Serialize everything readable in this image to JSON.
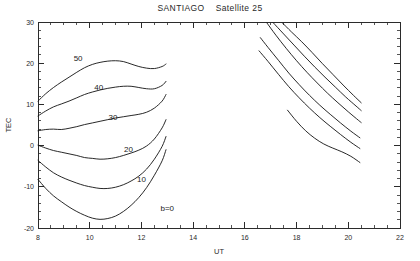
{
  "chart_data": {
    "type": "line",
    "title": "SANTIAGO    Satellite 25",
    "station": "SANTIAGO",
    "satellite_label": "Satellite 25",
    "xlabel": "UT",
    "ylabel": "TEC",
    "xlim": [
      8,
      22
    ],
    "ylim": [
      -20,
      30
    ],
    "xticks": [
      8,
      10,
      12,
      14,
      16,
      18,
      20,
      22
    ],
    "xtick_labels": [
      "8",
      "10",
      "12",
      "14",
      "16",
      "18",
      "20",
      "22"
    ],
    "yticks": [
      -20,
      -10,
      0,
      10,
      20,
      30
    ],
    "ytick_labels": [
      "-20",
      "-10",
      "0",
      "10",
      "20",
      "30"
    ],
    "minor_tick_step_x": 0.5,
    "minor_tick_step_y": 2,
    "grid": false,
    "legend": "none",
    "annotations": [
      {
        "text": "50",
        "x": 9.55,
        "y": 20.6
      },
      {
        "text": "40",
        "x": 10.35,
        "y": 13.4
      },
      {
        "text": "30",
        "x": 10.9,
        "y": 6.1
      },
      {
        "text": "20",
        "x": 11.5,
        "y": -1.6
      },
      {
        "text": "10",
        "x": 12.0,
        "y": -8.9
      },
      {
        "text": "b=0",
        "x": 13.0,
        "y": -15.8
      }
    ],
    "series": [
      {
        "name": "b=50 pass 1",
        "bias": 50,
        "pass": 1,
        "x": [
          8.0,
          8.3,
          8.6,
          8.9,
          9.2,
          9.5,
          9.8,
          10.1,
          10.4,
          10.7,
          11.0,
          11.3,
          11.6,
          11.9,
          12.2,
          12.5,
          12.8,
          12.95
        ],
        "y": [
          10.8,
          12.6,
          14.1,
          15.4,
          16.6,
          17.8,
          18.9,
          19.7,
          20.2,
          20.5,
          20.6,
          20.4,
          19.8,
          19.2,
          18.8,
          18.7,
          19.2,
          19.8
        ]
      },
      {
        "name": "b=40 pass 1",
        "bias": 40,
        "pass": 1,
        "x": [
          8.0,
          8.3,
          8.6,
          8.9,
          9.2,
          9.5,
          9.8,
          10.1,
          10.4,
          10.7,
          11.0,
          11.3,
          11.6,
          11.9,
          12.2,
          12.5,
          12.8,
          12.95
        ],
        "y": [
          7.2,
          8.4,
          9.4,
          10.1,
          10.8,
          11.6,
          12.4,
          13.0,
          13.5,
          13.9,
          14.2,
          14.4,
          14.4,
          14.1,
          13.8,
          13.8,
          14.6,
          15.6
        ]
      },
      {
        "name": "b=30 pass 1",
        "bias": 30,
        "pass": 1,
        "x": [
          8.0,
          8.3,
          8.6,
          8.9,
          9.2,
          9.5,
          9.8,
          10.1,
          10.4,
          10.7,
          11.0,
          11.3,
          11.6,
          11.9,
          12.2,
          12.5,
          12.8,
          12.95
        ],
        "y": [
          3.6,
          3.9,
          4.0,
          3.9,
          4.2,
          4.6,
          5.1,
          5.5,
          5.9,
          6.3,
          6.7,
          7.0,
          7.3,
          7.6,
          8.1,
          9.1,
          10.8,
          12.4
        ]
      },
      {
        "name": "b=20 pass 1",
        "bias": 20,
        "pass": 1,
        "x": [
          8.0,
          8.3,
          8.6,
          8.9,
          9.2,
          9.5,
          9.8,
          10.1,
          10.4,
          10.7,
          11.0,
          11.3,
          11.6,
          11.9,
          12.2,
          12.5,
          12.8,
          12.95
        ],
        "y": [
          0.1,
          -0.6,
          -1.2,
          -1.6,
          -2.0,
          -2.4,
          -2.9,
          -3.1,
          -3.3,
          -3.2,
          -2.9,
          -2.4,
          -1.8,
          -1.1,
          -0.1,
          1.6,
          4.3,
          6.3
        ]
      },
      {
        "name": "b=10 pass 1",
        "bias": 10,
        "pass": 1,
        "x": [
          8.0,
          8.3,
          8.6,
          8.9,
          9.2,
          9.5,
          9.8,
          10.1,
          10.4,
          10.7,
          11.0,
          11.3,
          11.6,
          11.9,
          12.2,
          12.5,
          12.8,
          12.95
        ],
        "y": [
          -3.6,
          -5.2,
          -6.6,
          -7.6,
          -8.4,
          -9.1,
          -9.7,
          -10.1,
          -10.4,
          -10.4,
          -10.1,
          -9.5,
          -8.6,
          -7.4,
          -5.7,
          -3.3,
          -0.2,
          2.2
        ]
      },
      {
        "name": "b=0 pass 1",
        "bias": 0,
        "pass": 1,
        "x": [
          8.0,
          8.3,
          8.6,
          8.9,
          9.2,
          9.5,
          9.8,
          10.1,
          10.4,
          10.7,
          11.0,
          11.3,
          11.6,
          11.9,
          12.2,
          12.5,
          12.8,
          12.95
        ],
        "y": [
          -8.2,
          -10.4,
          -12.2,
          -13.6,
          -14.9,
          -16.0,
          -16.9,
          -17.6,
          -17.9,
          -17.7,
          -17.1,
          -16.0,
          -14.5,
          -12.6,
          -10.2,
          -7.2,
          -3.7,
          -1.0
        ]
      },
      {
        "name": "b=50 pass 2",
        "bias": 50,
        "pass": 2,
        "x": [
          17.45,
          17.8,
          18.2,
          18.6,
          19.0,
          19.4,
          19.8,
          20.2,
          20.5
        ],
        "y": [
          29.8,
          27.6,
          25.2,
          22.6,
          19.9,
          17.3,
          14.7,
          12.2,
          10.4
        ]
      },
      {
        "name": "b=40 pass 2",
        "bias": 40,
        "pass": 2,
        "x": [
          17.1,
          17.5,
          17.9,
          18.3,
          18.7,
          19.1,
          19.5,
          19.9,
          20.3,
          20.5
        ],
        "y": [
          29.8,
          27.1,
          24.4,
          21.7,
          19.1,
          16.6,
          14.2,
          11.8,
          9.6,
          8.5
        ]
      },
      {
        "name": "b=30 pass 2",
        "bias": 30,
        "pass": 2,
        "x": [
          16.85,
          17.2,
          17.6,
          18.0,
          18.4,
          18.8,
          19.2,
          19.6,
          20.0,
          20.4,
          20.5
        ],
        "y": [
          29.8,
          26.8,
          23.6,
          20.6,
          17.8,
          15.2,
          12.7,
          10.4,
          8.2,
          6.1,
          5.6
        ]
      },
      {
        "name": "b=20 pass 2",
        "bias": 20,
        "pass": 2,
        "x": [
          16.6,
          16.9,
          17.3,
          17.7,
          18.1,
          18.5,
          18.9,
          19.3,
          19.7,
          20.1,
          20.45
        ],
        "y": [
          26.2,
          23.8,
          20.7,
          17.6,
          14.8,
          12.2,
          9.8,
          7.6,
          5.5,
          3.5,
          1.9
        ]
      },
      {
        "name": "b=10 pass 2",
        "bias": 10,
        "pass": 2,
        "x": [
          16.55,
          16.9,
          17.3,
          17.7,
          18.1,
          18.5,
          18.9,
          19.3,
          19.7,
          20.1,
          20.45
        ],
        "y": [
          23.0,
          20.4,
          17.3,
          14.3,
          11.6,
          9.1,
          6.8,
          4.7,
          2.7,
          0.8,
          -0.7
        ]
      },
      {
        "name": "b=0 pass 2",
        "bias": 0,
        "pass": 2,
        "x": [
          17.65,
          18.0,
          18.35,
          18.7,
          19.05,
          19.4,
          19.75,
          20.1,
          20.45
        ],
        "y": [
          8.6,
          5.9,
          3.6,
          1.8,
          0.4,
          -0.6,
          -1.5,
          -2.6,
          -4.1
        ]
      }
    ]
  },
  "axes": {
    "x_title": "UT",
    "y_title": "TEC"
  }
}
